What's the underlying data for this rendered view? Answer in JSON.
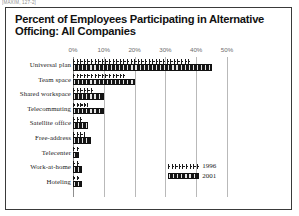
{
  "top_caption": "[MAXIM, 127-2]",
  "figure": {
    "title": "Percent of Employees Participating in Alternative Officing: All Companies"
  },
  "chart_data": {
    "type": "bar",
    "orientation": "horizontal",
    "title": "Percent of Employees Participating in Alternative Officing: All Companies",
    "xlabel": "",
    "ylabel": "",
    "xlim": [
      0,
      50
    ],
    "grid": true,
    "legend_position": "bottom-right",
    "tick_labels": [
      "0%",
      "10%",
      "20%",
      "30%",
      "40%",
      "50%"
    ],
    "tick_values": [
      0,
      10,
      20,
      30,
      40,
      50
    ],
    "categories": [
      "Universal plan",
      "Team space",
      "Shared workspace",
      "Telecommuting",
      "Satellite office",
      "Free-address",
      "Telecenter",
      "Work-at-home",
      "Hoteling"
    ],
    "series": [
      {
        "name": "1996",
        "values": [
          38,
          17,
          7,
          5,
          3,
          4,
          2,
          2,
          2
        ]
      },
      {
        "name": "2001",
        "values": [
          45,
          20,
          10,
          10,
          5,
          6,
          2,
          3,
          3
        ]
      }
    ]
  },
  "legend": {
    "items": [
      {
        "label": "1996",
        "swatch": "hatched-marker"
      },
      {
        "label": "2001",
        "swatch": "solid-dark"
      }
    ]
  }
}
